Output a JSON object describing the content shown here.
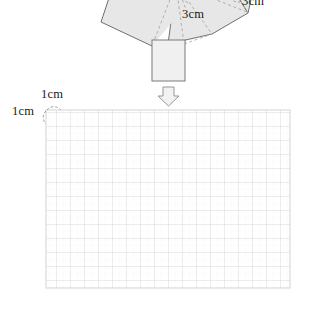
{
  "figure": {
    "title": "",
    "net": {
      "description": "partial net of a solid: fan of shaded polygons with dashed fold lines and a rectangular flap below",
      "fill_color": "#e7e7e7",
      "stroke_color": "#6f6f6f",
      "dash_color": "#a8a8a8",
      "labels": [
        {
          "name": "edge-length-center",
          "text": "3cm"
        },
        {
          "name": "edge-length-right",
          "text": "3cm"
        }
      ]
    },
    "arrow": {
      "name": "down-arrow",
      "direction": "down",
      "fill_color": "#f2f2f2",
      "stroke_color": "#8a8a8a"
    },
    "grid": {
      "name": "graph-paper",
      "cell_label_top": "1cm",
      "cell_label_left": "1cm",
      "columns": 17,
      "rows": 13,
      "cell_size_px": 14,
      "subdivisions": 2,
      "major_line_color": "#d6d6d6",
      "minor_line_color": "#e6e6e6",
      "border_color": "#cccccc"
    }
  }
}
